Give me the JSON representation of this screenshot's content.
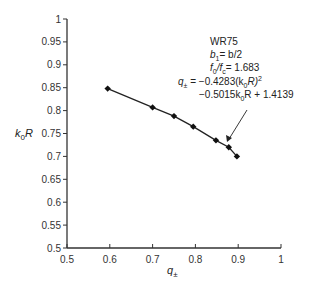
{
  "chart_data": {
    "type": "scatter",
    "title": "",
    "xlabel": "q±",
    "ylabel": "k0R",
    "xlim": [
      0.5,
      1.0
    ],
    "ylim": [
      0.5,
      1.0
    ],
    "xticks": [
      "0.5",
      "0.6",
      "0.7",
      "0.8",
      "0.9",
      "1"
    ],
    "yticks": [
      "0.5",
      "0.55",
      "0.6",
      "0.65",
      "0.7",
      "0.75",
      "0.8",
      "0.85",
      "0.9",
      "0.95",
      "1"
    ],
    "grid": false,
    "series": [
      {
        "name": "measured",
        "marker": "diamond",
        "line": "fitted curve",
        "x": [
          0.595,
          0.7,
          0.75,
          0.795,
          0.848,
          0.878,
          0.897
        ],
        "y": [
          0.848,
          0.807,
          0.788,
          0.765,
          0.735,
          0.72,
          0.7
        ]
      }
    ],
    "annotations": {
      "case": "WR75",
      "b_relation": {
        "lhs": "b",
        "lhs_sub": "1",
        "rhs": "= b/2"
      },
      "f_ratio": {
        "f0_sub": "0",
        "fc_sub": "c",
        "value": "= 1.683"
      },
      "equation_line1": {
        "lhs": "q",
        "lhs_sub": "±",
        "rhs_a": " = −0.4283(k",
        "rhs_sub": "0",
        "rhs_b": "R)",
        "sup": "2"
      },
      "equation_line2": {
        "a": "−0.5015k",
        "sub": "0",
        "b": "R + 1.4139"
      }
    }
  }
}
